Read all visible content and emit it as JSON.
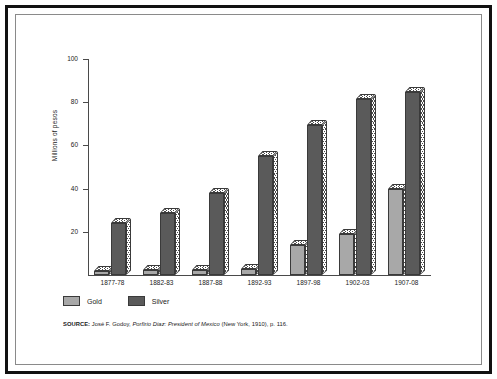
{
  "figure": {
    "y_axis_title": "Millions of pesos",
    "source_prefix": "SOURCE:",
    "source_author": "José F. Godoy,",
    "source_title": "Porfirio Diaz: President of Mexico",
    "source_pub": "(New York, 1910), p. 116."
  },
  "legend": {
    "items": [
      {
        "label": "Gold",
        "color": "#a8a8a8"
      },
      {
        "label": "Silver",
        "color": "#5a5a5a"
      }
    ]
  },
  "chart_data": {
    "type": "bar",
    "title": "",
    "xlabel": "",
    "ylabel": "Millions of pesos",
    "ylim": [
      0,
      100
    ],
    "yticks": [
      0,
      20,
      40,
      60,
      80,
      100
    ],
    "ytick_labels": [
      "",
      "20",
      "40",
      "60",
      "80",
      "100"
    ],
    "grid": false,
    "legend_position": "below-axes-left",
    "categories": [
      "1877-78",
      "1882-83",
      "1887-88",
      "1892-93",
      "1897-98",
      "1902-03",
      "1907-08"
    ],
    "series": [
      {
        "name": "Gold",
        "color": "#a8a8a8",
        "values": [
          2,
          2.5,
          2.5,
          3,
          14,
          19,
          40
        ]
      },
      {
        "name": "Silver",
        "color": "#5a5a5a",
        "values": [
          24,
          28.5,
          38,
          55,
          69.5,
          81.5,
          84.5
        ]
      }
    ]
  }
}
